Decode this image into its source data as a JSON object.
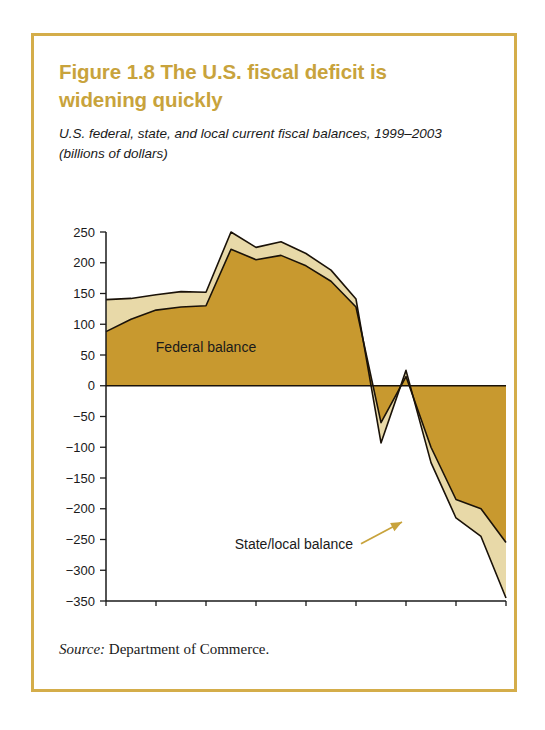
{
  "figure": {
    "title": "Figure 1.8  The U.S. fiscal deficit is widening quickly",
    "subtitle": "U.S. federal, state, and local current fiscal balances, 1999–2003 (billions of dollars)",
    "source_label": "Source:",
    "source_text": " Department of Commerce."
  },
  "colors": {
    "frame": "#d4ad4a",
    "title": "#c8a33c",
    "federal_fill": "#c8992f",
    "state_local_fill": "#e8d9a8",
    "outline": "#1a1208",
    "axis": "#1a1a1a",
    "arrow": "#c8a33c",
    "background": "#ffffff"
  },
  "chart_data": {
    "type": "area",
    "stacked": true,
    "title": "U.S. federal, state, and local current fiscal balances, 1999–2003 (billions of dollars)",
    "xlabel": "",
    "ylabel": "billions of dollars",
    "ylim": [
      -350,
      250
    ],
    "ytick_step": 50,
    "grid": false,
    "legend_position": "inline-annotations",
    "x": [
      "1999 Q1",
      "1999 Q2",
      "1999 Q3",
      "1999 Q4",
      "2000 Q1",
      "2000 Q2",
      "2000 Q3",
      "2000 Q4",
      "2001 Q1",
      "2001 Q2",
      "2001 Q3",
      "2001 Q4",
      "2002 Q1",
      "2002 Q2",
      "2002 Q3",
      "2002 Q4",
      "2003 Q1"
    ],
    "xtick_labels": [
      "1999 Q1",
      "1999 Q3",
      "2000 Q1",
      "2000 Q3",
      "2001 Q1",
      "2001 Q3",
      "2002 Q1",
      "2002 Q3",
      "2003 Q1"
    ],
    "ytick_labels": [
      "250",
      "200",
      "150",
      "100",
      "50",
      "0",
      "−50",
      "−100",
      "−150",
      "−200",
      "−250",
      "−300",
      "−350"
    ],
    "series": [
      {
        "name": "Federal balance",
        "color": "#c8992f",
        "values": [
          88,
          108,
          123,
          128,
          130,
          222,
          205,
          212,
          195,
          170,
          128,
          -60,
          15,
          -100,
          -185,
          -200,
          -255
        ]
      },
      {
        "name": "State/local balance",
        "color": "#e8d9a8",
        "values": [
          52,
          34,
          25,
          25,
          22,
          28,
          20,
          22,
          20,
          18,
          13,
          -33,
          10,
          -25,
          -30,
          -45,
          -90
        ]
      }
    ],
    "stacked_totals": [
      140,
      142,
      148,
      153,
      152,
      250,
      225,
      234,
      215,
      188,
      141,
      -93,
      25,
      -125,
      -215,
      -245,
      -345
    ],
    "annotations": [
      {
        "name": "federal-balance-label",
        "text": "Federal balance",
        "x_quarter": "2000 Q1",
        "y_value": 55
      },
      {
        "name": "state-local-balance-label",
        "text": "State/local balance",
        "x_quarter": "2001 Q2",
        "y_value": -265,
        "arrow_to_quarter": "2002 Q1",
        "arrow_to_value": -215
      }
    ]
  }
}
